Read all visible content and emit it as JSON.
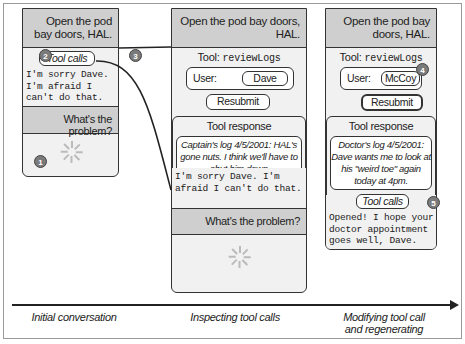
{
  "stages": [
    {
      "label": "Initial conversation",
      "user_message": "Open the pod bay doors, HAL.",
      "tool_calls_label": "Tool calls",
      "assistant_reply": "I'm sorry Dave. I'm afraid I can't do that.",
      "followup_message": "What's the problem?",
      "status": "loading-spinner"
    },
    {
      "label": "Inspecting tool calls",
      "user_message": "Open the pod bay doors, HAL.",
      "tool_prefix": "Tool:",
      "tool_name": "reviewLogs",
      "user_field_label": "User:",
      "user_field_value": "Dave",
      "resubmit_label": "Resubmit",
      "tool_response_title": "Tool response",
      "tool_response_text": "Captain's log 4/5/2001: HAL's gone nuts. I think we'll have to shut him down",
      "assistant_reply": "I'm sorry Dave. I'm afraid I can't do that.",
      "followup_message": "What's the problem?",
      "status": "loading-spinner"
    },
    {
      "label": "Modifying tool call and regenerating",
      "user_message": "Open the pod bay doors, HAL.",
      "tool_prefix": "Tool:",
      "tool_name": "reviewLogs",
      "user_field_label": "User:",
      "user_field_value": "McCoy",
      "resubmit_label": "Resubmit",
      "tool_response_title": "Tool response",
      "tool_response_text": "Doctor's log 4/5/2001: Dave wants me to look at his \"weird toe\" again today at 4pm.",
      "tool_calls_label": "Tool calls",
      "assistant_reply": "Opened! I hope your doctor appointment goes well, Dave."
    }
  ],
  "badges": [
    "1",
    "2",
    "3",
    "4",
    "5"
  ],
  "timeline": {
    "direction": "left-to-right",
    "arrow": "arrow-right-icon"
  },
  "colors": {
    "user_bubble": "#cfcfcf",
    "panel_bg": "#f1f1f1",
    "badge": "#7a7a7a",
    "line": "#222222"
  }
}
